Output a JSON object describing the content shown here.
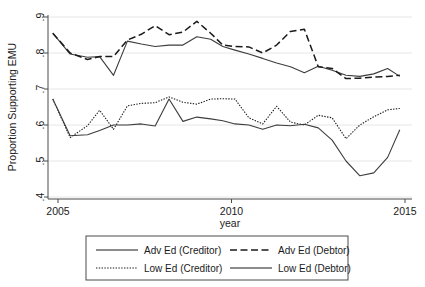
{
  "chart_data": {
    "type": "line",
    "title": "",
    "xlabel": "year",
    "ylabel": "Proportion Supporting EMU",
    "xlim": [
      2004.8,
      2014.9
    ],
    "ylim": [
      0.4,
      0.9
    ],
    "grid": true,
    "grid_axis": "y",
    "legend_position": "bottom-outside",
    "xticks": [
      2005,
      2010,
      2015
    ],
    "xtick_labels": [
      "2005",
      "2010",
      "2015"
    ],
    "yticks": [
      0.4,
      0.5,
      0.6,
      0.7,
      0.8,
      0.9
    ],
    "ytick_labels": [
      ".4",
      ".5",
      ".6",
      ".7",
      ".8",
      ".9"
    ],
    "x": [
      2004.85,
      2005.35,
      2005.85,
      2006.2,
      2006.6,
      2007.0,
      2007.4,
      2007.8,
      2008.2,
      2008.6,
      2009.0,
      2009.4,
      2009.75,
      2010.1,
      2010.5,
      2010.9,
      2011.3,
      2011.7,
      2012.1,
      2012.5,
      2012.9,
      2013.3,
      2013.7,
      2014.1,
      2014.5,
      2014.85
    ],
    "series": [
      {
        "name": "Adv Ed (Creditor)",
        "style": "solid",
        "color": "#3d3d3d",
        "values": [
          0.855,
          0.797,
          0.788,
          0.79,
          0.738,
          0.833,
          0.825,
          0.818,
          0.822,
          0.822,
          0.845,
          0.838,
          0.818,
          0.808,
          0.797,
          0.785,
          0.772,
          0.762,
          0.745,
          0.763,
          0.752,
          0.738,
          0.735,
          0.742,
          0.757,
          0.735
        ]
      },
      {
        "name": "Adv Ed (Debtor)",
        "style": "dashed",
        "color": "#1a1a1a",
        "values": [
          0.855,
          0.8,
          0.782,
          0.79,
          0.79,
          0.836,
          0.852,
          0.876,
          0.851,
          0.858,
          0.888,
          0.855,
          0.822,
          0.818,
          0.817,
          0.8,
          0.822,
          0.86,
          0.866,
          0.762,
          0.757,
          0.729,
          0.73,
          0.733,
          0.735,
          0.738
        ]
      },
      {
        "name": "Low Ed (Creditor)",
        "style": "dotted",
        "color": "#1a1a1a",
        "values": [
          0.672,
          0.565,
          0.598,
          0.641,
          0.588,
          0.653,
          0.66,
          0.662,
          0.678,
          0.663,
          0.658,
          0.672,
          0.673,
          0.672,
          0.62,
          0.603,
          0.652,
          0.608,
          0.6,
          0.627,
          0.62,
          0.562,
          0.6,
          0.623,
          0.642,
          0.646
        ]
      },
      {
        "name": "Low Ed (Debtor)",
        "style": "solid",
        "color": "#3d3d3d",
        "values": [
          0.672,
          0.57,
          0.573,
          0.585,
          0.6,
          0.6,
          0.603,
          0.597,
          0.672,
          0.61,
          0.622,
          0.617,
          0.612,
          0.603,
          0.6,
          0.588,
          0.6,
          0.598,
          0.602,
          0.592,
          0.558,
          0.5,
          0.459,
          0.467,
          0.51,
          0.587
        ]
      }
    ],
    "legend_entries": [
      {
        "label": "Adv Ed (Creditor)",
        "style": "solid"
      },
      {
        "label": "Adv Ed (Debtor)",
        "style": "dashed"
      },
      {
        "label": "Low Ed (Creditor)",
        "style": "dotted"
      },
      {
        "label": "Low Ed (Debtor)",
        "style": "solid"
      }
    ]
  }
}
